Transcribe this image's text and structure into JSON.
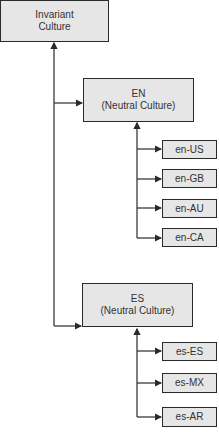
{
  "diagram": {
    "root": {
      "line1": "Invariant",
      "line2": "Culture"
    },
    "neutral": [
      {
        "code": "EN",
        "label": "(Neutral Culture)",
        "specific": [
          "en-US",
          "en-GB",
          "en-AU",
          "en-CA"
        ]
      },
      {
        "code": "ES",
        "label": "(Neutral Culture)",
        "specific": [
          "es-ES",
          "es-MX",
          "es-AR"
        ]
      }
    ]
  },
  "colors": {
    "box_fill": "#e6e6e6",
    "line": "#2a2a2a",
    "text": "#333333"
  }
}
